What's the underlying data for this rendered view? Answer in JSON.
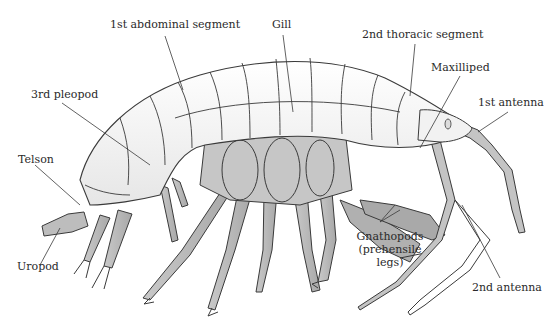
{
  "figure": {
    "colors": {
      "background": "#ffffff",
      "body_fill": "#f4f4f4",
      "limb_fill": "#b8b8b8",
      "gill_fill": "#c6c6c6",
      "outline": "#3a3a3a",
      "label_text": "#2a2a2a",
      "leader_line": "#3a3a3a"
    }
  },
  "labels": {
    "abdominal_segment": "1st abdominal segment",
    "gill": "Gill",
    "thoracic_segment": "2nd thoracic segment",
    "maxilliped": "Maxilliped",
    "first_antenna": "1st antenna",
    "pleopod": "3rd pleopod",
    "telson": "Telson",
    "uropod": "Uropod",
    "gnathopods_line1": "Gnathopods",
    "gnathopods_line2": "(prehensile",
    "gnathopods_line3": "legs)",
    "second_antenna": "2nd antenna"
  }
}
